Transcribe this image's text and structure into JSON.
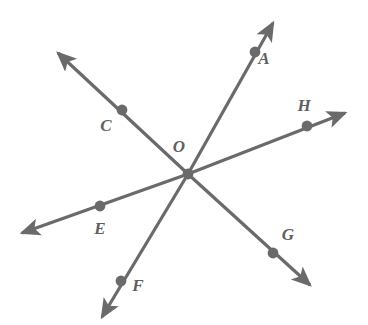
{
  "figure": {
    "type": "geometry-diagram",
    "width": 368,
    "height": 325,
    "background_color": "#ffffff",
    "stroke_color": "#6a6a6d",
    "label_color": "#5f5f62",
    "dot_color": "#6a6a6d",
    "stroke_width": 3.2,
    "dot_radius": 5.4
  },
  "center": {
    "id": "O",
    "label": "O",
    "x": 188,
    "y": 174,
    "label_x": 179,
    "label_y": 152,
    "has_dot": true
  },
  "points": [
    {
      "id": "A",
      "label": "A",
      "x": 255,
      "y": 52,
      "label_x": 264,
      "label_y": 64
    },
    {
      "id": "C",
      "label": "C",
      "x": 122,
      "y": 110,
      "label_x": 106,
      "label_y": 131
    },
    {
      "id": "H",
      "label": "H",
      "x": 307,
      "y": 126,
      "label_x": 304,
      "label_y": 111
    },
    {
      "id": "E",
      "label": "E",
      "x": 100,
      "y": 206,
      "label_x": 100,
      "label_y": 234
    },
    {
      "id": "G",
      "label": "G",
      "x": 273,
      "y": 253,
      "label_x": 288,
      "label_y": 240
    },
    {
      "id": "F",
      "label": "F",
      "x": 121,
      "y": 281,
      "label_x": 138,
      "label_y": 291
    }
  ],
  "rays": [
    {
      "id": "ray-OA",
      "through": "A",
      "tip_x": 273,
      "tip_y": 23,
      "arrow": true
    },
    {
      "id": "ray-OF",
      "through": "F",
      "tip_x": 102,
      "tip_y": 317,
      "arrow": true
    },
    {
      "id": "ray-OC",
      "through": "C",
      "tip_x": 58,
      "tip_y": 53,
      "arrow": true
    },
    {
      "id": "ray-OG",
      "through": "G",
      "tip_x": 310,
      "tip_y": 285,
      "arrow": true
    },
    {
      "id": "ray-OH",
      "through": "H",
      "tip_x": 345,
      "tip_y": 113,
      "arrow": true
    },
    {
      "id": "ray-OE",
      "through": "E",
      "tip_x": 22,
      "tip_y": 233,
      "arrow": true
    }
  ],
  "lines": [
    {
      "id": "line-AF",
      "endpoints": [
        "A",
        "F"
      ]
    },
    {
      "id": "line-CG",
      "endpoints": [
        "C",
        "G"
      ]
    },
    {
      "id": "line-EH",
      "endpoints": [
        "E",
        "H"
      ]
    }
  ]
}
